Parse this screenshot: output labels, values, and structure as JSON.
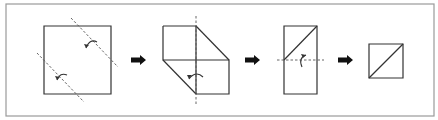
{
  "diagram": {
    "type": "origami-fold-sequence",
    "colors": {
      "frame": "#9a9a9a",
      "edge": "#333333",
      "fold_line": "#555555",
      "step_arrow": "#111111"
    },
    "frame": {
      "x": 6,
      "y": 4,
      "w": 428,
      "h": 112
    },
    "steps": [
      {
        "name": "step-1-square-with-two-diagonal-folds",
        "edges": [
          "M44 26 H111 V94 H44 Z"
        ],
        "folds": [
          "M71 18 L118 67",
          "M37 53 L84 102"
        ],
        "curls": [
          {
            "path": "M86 48 Q90 38 97 42",
            "head": "86,48 84,44 89,45"
          },
          {
            "path": "M57 80 Q60 72 67 75",
            "head": "57,80 55,76 60,77"
          }
        ]
      },
      {
        "name": "step-2-folded-parallelogram",
        "edges": [
          "M163 26 H196 V94",
          "M163 26 V60 H229 V94 H196",
          "M196 26 L229 60",
          "M163 60 L196 94"
        ],
        "folds": [
          "M196 16 V105"
        ],
        "curls": [
          {
            "path": "M189 79 Q196 70 203 77",
            "head": "189,79 187,75 192,75"
          }
        ]
      },
      {
        "name": "step-3-rectangle-horizontal-fold",
        "edges": [
          "M284 26 H317 V94 H284 Z",
          "M284 60 L317 26"
        ],
        "folds": [
          "M277 60 H324"
        ],
        "curls": [
          {
            "path": "M302 67 Q298 58 306 55",
            "head": "306,55 301,54 303,58"
          }
        ]
      },
      {
        "name": "step-4-final-small-square",
        "edges": [
          "M369 44 H403 V78 H369 Z",
          "M369 78 L403 44"
        ],
        "folds": [],
        "curls": []
      }
    ],
    "step_arrows": [
      {
        "x": 131,
        "y": 60
      },
      {
        "x": 245,
        "y": 60
      },
      {
        "x": 338,
        "y": 60
      }
    ]
  }
}
